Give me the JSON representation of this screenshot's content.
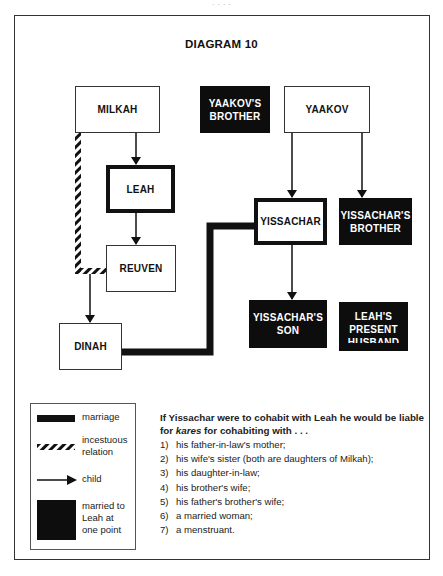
{
  "page": {
    "header_fragment": "· · · ·"
  },
  "diagram": {
    "title": "DIAGRAM 10",
    "nodes": {
      "milkah": {
        "label": "MILKAH",
        "style": "plain"
      },
      "yaakovs_brother": {
        "lines": [
          "YAAKOV'S",
          "BROTHER"
        ],
        "style": "dark"
      },
      "yaakov": {
        "label": "YAAKOV",
        "style": "plain"
      },
      "leah": {
        "label": "LEAH",
        "style": "thick"
      },
      "reuven": {
        "label": "REUVEN",
        "style": "plain"
      },
      "yissachar": {
        "label": "YISSACHAR",
        "style": "thick"
      },
      "yissachars_brother": {
        "lines": [
          "YISSACHAR'S",
          "BROTHER"
        ],
        "style": "dark"
      },
      "dinah": {
        "label": "DINAH",
        "style": "plain"
      },
      "yissachars_son": {
        "lines": [
          "YISSACHAR'S",
          "SON"
        ],
        "style": "dark"
      },
      "leahs_present_husband": {
        "lines": [
          "LEAH'S",
          "PRESENT",
          "HUSBAND"
        ],
        "style": "dark"
      }
    },
    "edges": [
      {
        "from": "milkah",
        "to": "leah",
        "type": "child"
      },
      {
        "from": "leah",
        "to": "reuven",
        "type": "child"
      },
      {
        "from": "yaakov",
        "to": "yissachar",
        "type": "child"
      },
      {
        "from": "yaakov",
        "to": "yissachars_brother",
        "type": "child"
      },
      {
        "from": "yissachar",
        "to": "yissachars_son",
        "type": "child"
      },
      {
        "from": "milkah",
        "to": "dinah",
        "type": "child"
      },
      {
        "from": "milkah",
        "to": "reuven",
        "type": "incestuous relation"
      },
      {
        "from": "dinah",
        "to": "yissachar",
        "type": "marriage"
      }
    ]
  },
  "legend": {
    "items": [
      {
        "symbol": "thick-black-bar",
        "label": "marriage"
      },
      {
        "symbol": "hatched-bar",
        "label_lines": [
          "incestuous",
          "relation"
        ]
      },
      {
        "symbol": "arrow",
        "label": "child"
      },
      {
        "symbol": "black-square",
        "label_lines": [
          "married to",
          "Leah at",
          "one point"
        ]
      }
    ]
  },
  "notes": {
    "lead_part1": "If Yissachar were to cohabit with Leah he would be liable for ",
    "lead_italic": "kares",
    "lead_part2": " for cohabiting with . . .",
    "items": [
      {
        "num": "1)",
        "text": "his father-in-law's mother;"
      },
      {
        "num": "2)",
        "text": "his wife's sister (both are daughters of Milkah);"
      },
      {
        "num": "3)",
        "text": "his daughter-in-law;"
      },
      {
        "num": "4)",
        "text": "his brother's wife;"
      },
      {
        "num": "5)",
        "text": "his father's brother's wife;"
      },
      {
        "num": "6)",
        "text": "a married woman;"
      },
      {
        "num": "7)",
        "text": "a menstruant."
      }
    ]
  },
  "colors": {
    "ink": "#111111",
    "dark_box": "#0d0d0d",
    "frame": "#333333",
    "background": "#ffffff"
  }
}
